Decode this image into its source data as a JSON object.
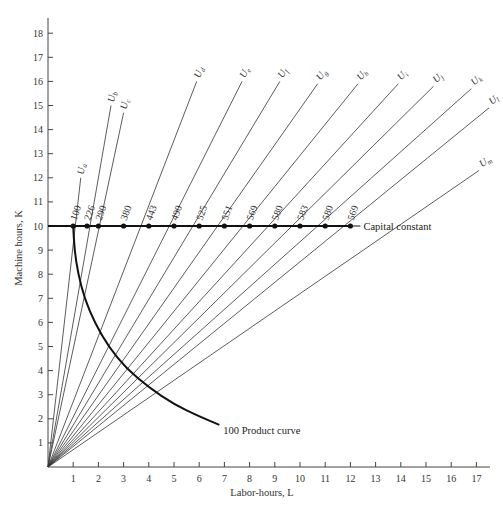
{
  "chart_data": {
    "type": "line",
    "title": "",
    "xlabel": "Labor-hours, L",
    "ylabel": "Machine hours, K",
    "xlim": [
      0,
      17.5
    ],
    "ylim": [
      0,
      18.5
    ],
    "x_ticks": [
      1,
      2,
      3,
      4,
      5,
      6,
      7,
      8,
      9,
      10,
      11,
      12,
      13,
      14,
      15,
      16,
      17
    ],
    "y_ticks": [
      1,
      2,
      3,
      4,
      5,
      6,
      7,
      8,
      9,
      10,
      11,
      12,
      13,
      14,
      15,
      16,
      17,
      18
    ],
    "grid": false,
    "capital_constant": {
      "label": "Capital constant",
      "K": 10,
      "x_start": 0,
      "x_end": 12,
      "points": [
        {
          "L": 1,
          "output": "100"
        },
        {
          "L": 1.55,
          "output": "226"
        },
        {
          "L": 2,
          "output": "290"
        },
        {
          "L": 3,
          "output": "380"
        },
        {
          "L": 4,
          "output": "443"
        },
        {
          "L": 5,
          "output": "490"
        },
        {
          "L": 6,
          "output": "525"
        },
        {
          "L": 7,
          "output": "551"
        },
        {
          "L": 8,
          "output": "569"
        },
        {
          "L": 9,
          "output": "580"
        },
        {
          "L": 10,
          "output": "583"
        },
        {
          "L": 11,
          "output": "580"
        },
        {
          "L": 12,
          "output": "569"
        }
      ]
    },
    "rays": [
      {
        "name": "U",
        "sub": "a",
        "end": [
          1.3,
          12.0
        ]
      },
      {
        "name": "U",
        "sub": "b",
        "end": [
          2.5,
          15.0
        ]
      },
      {
        "name": "U",
        "sub": "c",
        "end": [
          3.0,
          14.7
        ]
      },
      {
        "name": "U",
        "sub": "d",
        "end": [
          5.9,
          16.0
        ]
      },
      {
        "name": "U",
        "sub": "e",
        "end": [
          7.7,
          16.0
        ]
      },
      {
        "name": "U",
        "sub": "f",
        "end": [
          9.2,
          16.0
        ]
      },
      {
        "name": "U",
        "sub": "g",
        "end": [
          10.7,
          15.9
        ]
      },
      {
        "name": "U",
        "sub": "h",
        "end": [
          12.3,
          15.9
        ]
      },
      {
        "name": "U",
        "sub": "i",
        "end": [
          13.9,
          15.9
        ]
      },
      {
        "name": "U",
        "sub": "j",
        "end": [
          15.3,
          15.8
        ]
      },
      {
        "name": "U",
        "sub": "k",
        "end": [
          16.8,
          15.7
        ]
      },
      {
        "name": "U",
        "sub": "l",
        "end": [
          17.5,
          14.9
        ]
      },
      {
        "name": "U",
        "sub": "m",
        "end": [
          17.1,
          12.3
        ]
      }
    ],
    "isoquant": {
      "label": "100 Product curve",
      "points": [
        [
          1.0,
          10.0
        ],
        [
          1.05,
          9.0
        ],
        [
          1.2,
          8.0
        ],
        [
          1.45,
          7.0
        ],
        [
          1.85,
          6.0
        ],
        [
          2.4,
          5.0
        ],
        [
          3.1,
          4.1
        ],
        [
          4.0,
          3.3
        ],
        [
          5.0,
          2.6
        ],
        [
          6.0,
          2.1
        ],
        [
          6.8,
          1.75
        ]
      ]
    }
  }
}
